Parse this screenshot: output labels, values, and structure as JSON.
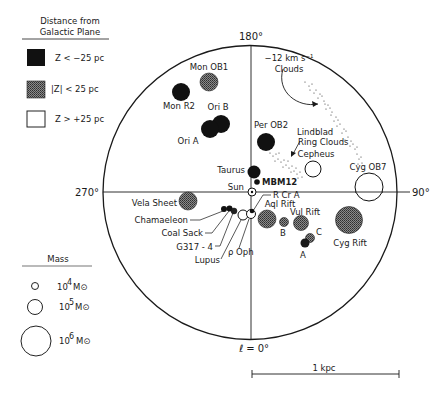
{
  "legend_distance": {
    "title_line1": "Distance from",
    "title_line2": "Galactic Plane",
    "items": [
      {
        "label": "Z < −25 pc",
        "fill": "dark"
      },
      {
        "label": "|Z| < 25 pc",
        "fill": "hatched"
      },
      {
        "label": "Z > +25 pc",
        "fill": "open"
      }
    ]
  },
  "legend_mass": {
    "title": "Mass",
    "items": [
      {
        "exp": "4",
        "label_base": "10",
        "unit": "M⊙"
      },
      {
        "exp": "5",
        "label_base": "10",
        "unit": "M⊙"
      },
      {
        "exp": "6",
        "label_base": "10",
        "unit": "M⊙"
      }
    ]
  },
  "axes": {
    "top": "180°",
    "left": "270°",
    "right": "90°",
    "bottom": "ℓ = 0°"
  },
  "scale_bar": {
    "label": "1 kpc"
  },
  "annotations": {
    "clouds_12": "−12 km s⁻¹",
    "clouds_12_line2": "Clouds",
    "lindblad_line1": "Lindblad",
    "lindblad_line2": "Ring Clouds"
  },
  "clouds": [
    {
      "name": "Mon OB1",
      "fill": "hatched"
    },
    {
      "name": "Mon R2",
      "fill": "dark"
    },
    {
      "name": "Ori B",
      "fill": "dark"
    },
    {
      "name": "Ori A",
      "fill": "dark"
    },
    {
      "name": "Per OB2",
      "fill": "dark"
    },
    {
      "name": "Taurus",
      "fill": "dark"
    },
    {
      "name": "MBM12",
      "fill": "dark"
    },
    {
      "name": "Sun",
      "fill": "sun"
    },
    {
      "name": "R Cr A",
      "fill": "dark"
    },
    {
      "name": "Cepheus",
      "fill": "open"
    },
    {
      "name": "Cyg OB7",
      "fill": "open"
    },
    {
      "name": "Vela Sheet",
      "fill": "hatched"
    },
    {
      "name": "Chamaeleon",
      "fill": "dark"
    },
    {
      "name": "Coal Sack",
      "fill": "dark"
    },
    {
      "name": "G317 - 4",
      "fill": "dark"
    },
    {
      "name": "Lupus",
      "fill": "open"
    },
    {
      "name": "ρ Oph",
      "fill": "open"
    },
    {
      "name": "Aql Rift",
      "fill": "hatched"
    },
    {
      "name": "B",
      "fill": "hatched"
    },
    {
      "name": "Vul Rift",
      "fill": "hatched"
    },
    {
      "name": "C",
      "fill": "hatched"
    },
    {
      "name": "A",
      "fill": "dark"
    },
    {
      "name": "Cyg Rift",
      "fill": "hatched"
    }
  ],
  "colors": {
    "ink": "#1a1a1a",
    "paper": "#ffffff",
    "hatch": "#6e6e6e"
  }
}
